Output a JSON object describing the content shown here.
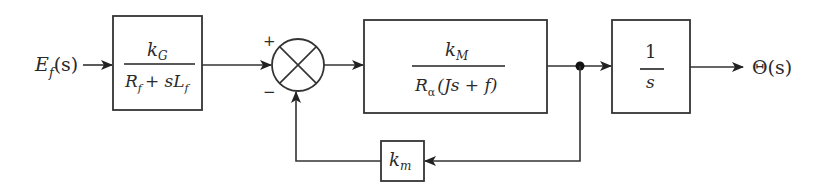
{
  "diagram": {
    "type": "control-system-block-diagram",
    "input": {
      "main": "E",
      "sub": "f",
      "arg": "(s)"
    },
    "output": {
      "label": "Θ(s)"
    },
    "blocks": [
      {
        "id": "field",
        "num_main": "k",
        "num_sub": "G",
        "den": "R_f + sL_f",
        "den_parts": {
          "r": "R",
          "r_sub": "f",
          "plus": "+ s",
          "l": "L",
          "l_sub": "f"
        }
      },
      {
        "id": "motor",
        "num_main": "k",
        "num_sub": "M",
        "den": "R_α(Js + f)",
        "den_parts": {
          "r": "R",
          "r_sub": "α",
          "rest": "(Js + f)"
        }
      },
      {
        "id": "integrator",
        "num": "1",
        "den": "s"
      },
      {
        "id": "feedback",
        "main": "k",
        "sub": "m"
      }
    ],
    "summing_junction": {
      "plus_sign": "+",
      "minus_sign": "−"
    },
    "colors": {
      "stroke": "#333333",
      "text": "#2a2a2a",
      "background": "#ffffff"
    }
  }
}
